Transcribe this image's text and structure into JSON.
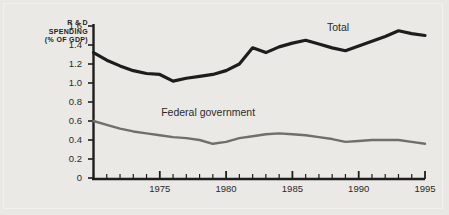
{
  "figure": {
    "background_color": "#e9e8e4",
    "axis_title_lines": [
      "R & D",
      "SPENDING",
      "(% OF GDP)"
    ]
  },
  "chart_data": {
    "type": "line",
    "title": "",
    "subtitle": "",
    "xlabel": "",
    "ylabel": "R & D SPENDING (% OF GDP)",
    "xlim": [
      1970,
      1995
    ],
    "ylim": [
      0,
      1.6
    ],
    "grid": false,
    "legend_position": "inline-annotations",
    "x": [
      1970,
      1971,
      1972,
      1973,
      1974,
      1975,
      1976,
      1977,
      1978,
      1979,
      1980,
      1981,
      1982,
      1983,
      1984,
      1985,
      1986,
      1987,
      1988,
      1989,
      1990,
      1991,
      1992,
      1993,
      1994,
      1995
    ],
    "y_ticks": [
      0,
      0.2,
      0.4,
      0.6,
      0.8,
      1.0,
      1.2,
      1.4,
      1.6
    ],
    "y_tick_labels": [
      "0",
      "0.2",
      "0.4",
      "0.6",
      "0.8",
      "1.0",
      "1.2",
      "1.4",
      "1.6"
    ],
    "x_ticks_major": [
      1975,
      1980,
      1985,
      1990,
      1995
    ],
    "x_tick_labels": [
      "1975",
      "1980",
      "1985",
      "1990",
      "1995"
    ],
    "series": [
      {
        "name": "Total",
        "color": "#1d1d1d",
        "width": 3.2,
        "label_x": 1987.6,
        "label_y": 1.58,
        "values": [
          1.32,
          1.24,
          1.18,
          1.13,
          1.1,
          1.09,
          1.02,
          1.05,
          1.07,
          1.09,
          1.13,
          1.2,
          1.37,
          1.32,
          1.38,
          1.42,
          1.45,
          1.41,
          1.37,
          1.34,
          1.39,
          1.44,
          1.49,
          1.55,
          1.52,
          1.5
        ]
      },
      {
        "name": "Federal government",
        "color": "#6f6f6c",
        "width": 2.4,
        "label_x": 1975.1,
        "label_y": 0.68,
        "values": [
          0.6,
          0.56,
          0.52,
          0.49,
          0.47,
          0.45,
          0.43,
          0.42,
          0.4,
          0.36,
          0.38,
          0.42,
          0.44,
          0.46,
          0.47,
          0.46,
          0.45,
          0.43,
          0.41,
          0.38,
          0.39,
          0.4,
          0.4,
          0.4,
          0.38,
          0.36
        ]
      }
    ]
  }
}
